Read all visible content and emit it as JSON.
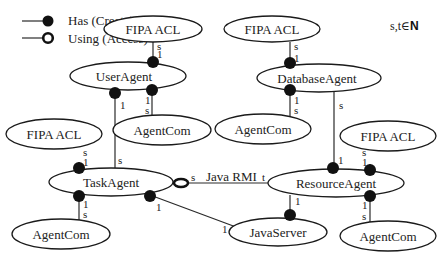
{
  "legend": {
    "has_label": "Has (Create)",
    "using_label": "Using (Access)"
  },
  "note": {
    "text": "s,t∈",
    "set": "N"
  },
  "nodes": {
    "fipa_top_left": "FIPA ACL",
    "fipa_top_right": "FIPA ACL",
    "user_agent": "UserAgent",
    "database_agent": "DatabaseAgent",
    "fipa_mid_left": "FIPA ACL",
    "agentcom_user": "AgentCom",
    "agentcom_db": "AgentCom",
    "fipa_mid_right": "FIPA ACL",
    "task_agent": "TaskAgent",
    "resource_agent": "ResourceAgent",
    "agentcom_task": "AgentCom",
    "java_server": "JavaServer",
    "agentcom_resource": "AgentCom"
  },
  "edges": {
    "java_rmi_label": "Java RMI",
    "s": "s",
    "t": "t",
    "one": "1"
  }
}
